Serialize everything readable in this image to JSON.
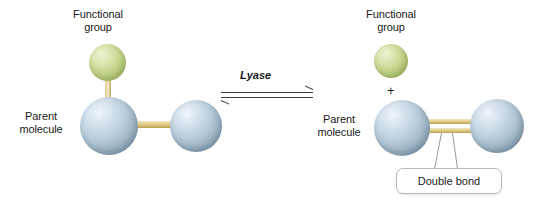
{
  "figure": {
    "type": "diagram",
    "background_color": "#ffffff",
    "colors": {
      "parent_sphere": "#bccfdd",
      "functional_group_sphere": "#c9da96",
      "bond": "#dcc583",
      "text": "#1a1a1a",
      "arrow": "#3d3d3d",
      "callout_border": "#b9b9b9"
    }
  },
  "left_side": {
    "functional_group_label": "Functional\ngroup",
    "parent_molecule_label": "Parent\nmolecule",
    "atoms": [
      {
        "id": "fg",
        "kind": "functional-group",
        "color": "#c9da96"
      },
      {
        "id": "parent-left",
        "kind": "parent",
        "color": "#bccfdd"
      },
      {
        "id": "parent-right",
        "kind": "parent",
        "color": "#bccfdd"
      }
    ],
    "bonds": [
      {
        "from": "parent-left",
        "to": "fg",
        "order": 1,
        "orientation": "vertical"
      },
      {
        "from": "parent-left",
        "to": "parent-right",
        "order": 1,
        "orientation": "horizontal"
      }
    ]
  },
  "reaction": {
    "enzyme_label": "Lyase",
    "arrow_type": "equilibrium",
    "forward_direction": "right",
    "reverse_direction": "left"
  },
  "right_side": {
    "functional_group_label": "Functional\ngroup",
    "parent_molecule_label": "Parent\nmolecule",
    "plus_sign": "+",
    "callout_label": "Double bond",
    "atoms": [
      {
        "id": "fg",
        "kind": "functional-group",
        "color": "#c9da96"
      },
      {
        "id": "parent-left",
        "kind": "parent",
        "color": "#bccfdd"
      },
      {
        "id": "parent-right",
        "kind": "parent",
        "color": "#bccfdd"
      }
    ],
    "bonds": [
      {
        "from": "parent-left",
        "to": "parent-right",
        "order": 2,
        "orientation": "horizontal"
      }
    ]
  }
}
